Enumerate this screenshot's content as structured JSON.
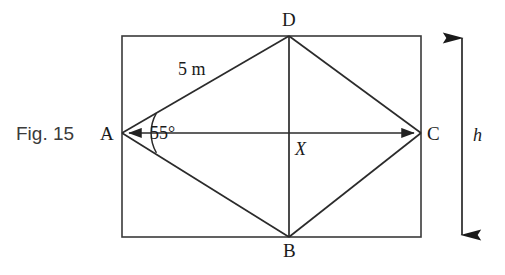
{
  "figure": {
    "caption": "Fig. 15",
    "shape_type": "rhombus-in-rectangle",
    "rectangle": {
      "x": 122,
      "y": 36,
      "width": 299,
      "height": 201,
      "stroke": "#333333"
    },
    "vertices": [
      {
        "name": "A",
        "label": "A",
        "x": 122,
        "y": 133,
        "label_x": 100,
        "label_y": 124
      },
      {
        "name": "D",
        "label": "D",
        "x": 289,
        "y": 36,
        "label_x": 282,
        "label_y": 10
      },
      {
        "name": "C",
        "label": "C",
        "x": 421,
        "y": 133,
        "label_x": 427,
        "label_y": 124
      },
      {
        "name": "B",
        "label": "B",
        "x": 289,
        "y": 237,
        "label_x": 283,
        "label_y": 241
      }
    ],
    "center_point": {
      "name": "X",
      "label": "X",
      "x": 289,
      "y": 133,
      "label_x": 295,
      "label_y": 140
    },
    "edges": [
      {
        "from": "A",
        "to": "D"
      },
      {
        "from": "D",
        "to": "C"
      },
      {
        "from": "C",
        "to": "B"
      },
      {
        "from": "B",
        "to": "A"
      }
    ],
    "diagonals": [
      {
        "from": "A",
        "to": "C",
        "arrowheads": "both"
      },
      {
        "from": "D",
        "to": "B",
        "arrowheads": "none"
      }
    ],
    "side_label": {
      "text": "5 m",
      "x": 178,
      "y": 60
    },
    "angle": {
      "text": "55°",
      "value": 55,
      "at_vertex": "A",
      "label_x": 150,
      "label_y": 124,
      "arc_radius": 40
    },
    "height_measure": {
      "label": "h",
      "label_x": 473,
      "label_y": 126,
      "arrow_x": 462,
      "arrow_top": 36,
      "arrow_bottom": 237,
      "arrowheads": "both"
    },
    "colors": {
      "ink": "#1a1a1a",
      "line": "#333333",
      "background": "#ffffff",
      "caption": "#3b3b3b"
    }
  }
}
